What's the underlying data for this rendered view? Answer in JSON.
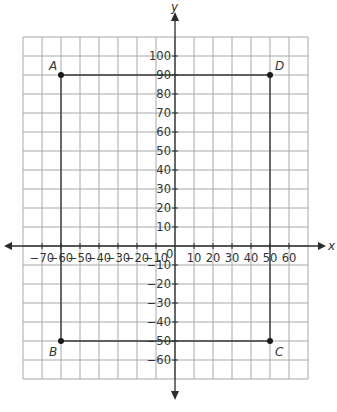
{
  "diagram": {
    "type": "coordinate-plane",
    "x_axis": {
      "name": "x",
      "min": -80,
      "max": 70,
      "step": 10,
      "tick_labels": [
        "-70",
        "-60",
        "-50",
        "-40",
        "-30",
        "-20",
        "-10",
        "10",
        "20",
        "30",
        "40",
        "50",
        "60"
      ]
    },
    "y_axis": {
      "name": "y",
      "min": -70,
      "max": 110,
      "step": 10,
      "tick_labels": [
        "100",
        "90",
        "80",
        "70",
        "60",
        "50",
        "40",
        "30",
        "20",
        "10",
        "-10",
        "-20",
        "-30",
        "-40",
        "-50",
        "-60"
      ]
    },
    "origin_label": "0",
    "points": [
      {
        "label": "A",
        "x": -60,
        "y": 90
      },
      {
        "label": "D",
        "x": 50,
        "y": 90
      },
      {
        "label": "C",
        "x": 50,
        "y": -50
      },
      {
        "label": "B",
        "x": -60,
        "y": -50
      }
    ],
    "polygon": [
      "A",
      "D",
      "C",
      "B"
    ],
    "colors": {
      "grid": "#a8a8a8",
      "axis": "#2b2b2b",
      "shape": "#3a3a3a",
      "text": "#333333"
    }
  }
}
